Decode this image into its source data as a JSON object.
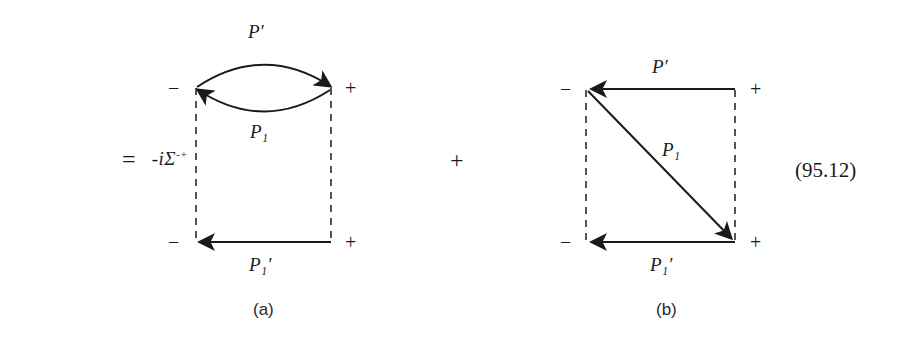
{
  "equation": {
    "lhs": "-iΣ",
    "lhs_superscript": "-+",
    "equals": "=",
    "plus": "+",
    "number": "(95.12)"
  },
  "diagrams": [
    {
      "id": "a",
      "caption": "(a)",
      "vertices": [
        {
          "name": "top-left",
          "sign": "−"
        },
        {
          "name": "top-right",
          "sign": "+"
        },
        {
          "name": "bottom-left",
          "sign": "−"
        },
        {
          "name": "bottom-right",
          "sign": "+"
        }
      ],
      "propagators": [
        {
          "name": "upper-arc",
          "label": "P",
          "prime": true,
          "subscript": "",
          "direction": "right"
        },
        {
          "name": "lower-arc",
          "label": "P",
          "prime": false,
          "subscript": "1",
          "direction": "left"
        },
        {
          "name": "bottom-line",
          "label": "P",
          "prime": true,
          "subscript": "1",
          "direction": "left"
        },
        {
          "name": "left-dashed",
          "label": "",
          "prime": false,
          "subscript": "",
          "direction": "none"
        },
        {
          "name": "right-dashed",
          "label": "",
          "prime": false,
          "subscript": "",
          "direction": "none"
        }
      ],
      "labels": {
        "top": "P′",
        "middle": "P₁",
        "bottom": "P₁′"
      }
    },
    {
      "id": "b",
      "caption": "(b)",
      "vertices": [
        {
          "name": "top-left",
          "sign": "−"
        },
        {
          "name": "top-right",
          "sign": "+"
        },
        {
          "name": "bottom-left",
          "sign": "−"
        },
        {
          "name": "bottom-right",
          "sign": "+"
        }
      ],
      "propagators": [
        {
          "name": "top-line",
          "label": "P",
          "prime": true,
          "subscript": "",
          "direction": "left"
        },
        {
          "name": "diagonal-line",
          "label": "P",
          "prime": false,
          "subscript": "1",
          "direction": "down-right"
        },
        {
          "name": "bottom-line",
          "label": "P",
          "prime": true,
          "subscript": "1",
          "direction": "left"
        },
        {
          "name": "left-dashed",
          "label": "",
          "prime": false,
          "subscript": "",
          "direction": "none"
        },
        {
          "name": "right-dashed",
          "label": "",
          "prime": false,
          "subscript": "",
          "direction": "none"
        }
      ],
      "labels": {
        "top": "P′",
        "middle": "P₁",
        "bottom": "P₁′"
      }
    }
  ],
  "colors": {
    "ink": "#1a1a1a",
    "background": "#ffffff",
    "dashed": "#2a2a2a"
  }
}
